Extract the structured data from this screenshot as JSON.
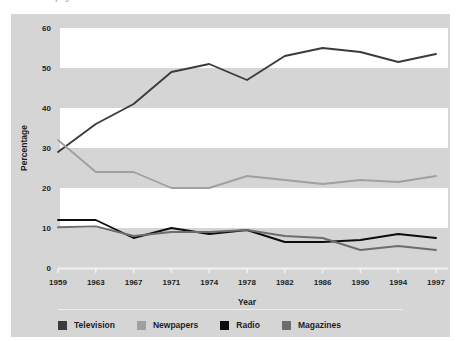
{
  "figure": {
    "panel_bg": "#d5d5d5",
    "band_color": "#ffffff",
    "clipped_caption_above": "p  y"
  },
  "chart_data": {
    "type": "line",
    "title": "",
    "subtitle": "",
    "xlabel": "Year",
    "ylabel": "Percentage",
    "categories": [
      "1959",
      "1963",
      "1967",
      "1971",
      "1974",
      "1978",
      "1982",
      "1986",
      "1990",
      "1994",
      "1997"
    ],
    "x": [
      1959,
      1963,
      1967,
      1971,
      1974,
      1978,
      1982,
      1986,
      1990,
      1994,
      1997
    ],
    "ylim": [
      0,
      60
    ],
    "yticks": [
      0,
      10,
      20,
      30,
      40,
      50,
      60
    ],
    "ytick_labels": [
      "0",
      "10",
      "20",
      "30",
      "40",
      "50",
      "60"
    ],
    "grid": false,
    "banded_background": true,
    "band_ranges": [
      [
        10,
        20
      ],
      [
        30,
        40
      ],
      [
        50,
        60
      ]
    ],
    "legend_position": "bottom",
    "series": [
      {
        "name": "Television",
        "color": "#3b3b3b",
        "values": [
          29,
          36,
          41,
          49,
          51,
          47,
          53,
          55,
          54,
          51.5,
          53.5
        ]
      },
      {
        "name": "Newpapers",
        "color": "#a0a0a0",
        "values": [
          32,
          24,
          24,
          20,
          20,
          23,
          22,
          21,
          22,
          21.5,
          23
        ]
      },
      {
        "name": "Radio",
        "color": "#0d0d0d",
        "values": [
          12,
          12,
          7.5,
          10,
          8.5,
          9.5,
          6.5,
          6.5,
          7,
          8.5,
          7.5
        ]
      },
      {
        "name": "Magazines",
        "color": "#6d6d6d",
        "values": [
          10.2,
          10.4,
          8,
          9,
          9,
          9.5,
          8,
          7.5,
          4.5,
          5.5,
          4.5
        ]
      }
    ]
  },
  "legend": {
    "items": [
      {
        "label": "Television",
        "color": "#3b3b3b"
      },
      {
        "label": "Newpapers",
        "color": "#a0a0a0"
      },
      {
        "label": "Radio",
        "color": "#0d0d0d"
      },
      {
        "label": "Magazines",
        "color": "#6d6d6d"
      }
    ]
  }
}
